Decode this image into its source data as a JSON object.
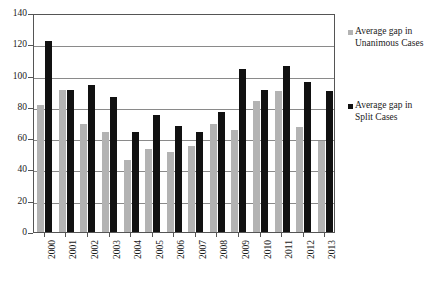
{
  "chart_data": {
    "type": "bar",
    "title": "",
    "subtitle": "",
    "xlabel": "",
    "ylabel": "",
    "ylim": [
      0,
      140
    ],
    "ytick_step": 20,
    "yticks": [
      0,
      20,
      40,
      60,
      80,
      100,
      120,
      140
    ],
    "grid": true,
    "legend_position": "right",
    "categories": [
      "2000",
      "2001",
      "2002",
      "2003",
      "2004",
      "2005",
      "2006",
      "2007",
      "2008",
      "2009",
      "2010",
      "2011",
      "2012",
      "2013"
    ],
    "series": [
      {
        "name": "Average gap in Unanimous Cases",
        "color": "#b3b3b3",
        "values": [
          81,
          91,
          69,
          64,
          46,
          53,
          51,
          55,
          69,
          65,
          84,
          90,
          67,
          58
        ]
      },
      {
        "name": "Average gap in Split Cases",
        "color": "#111111",
        "values": [
          122,
          91,
          94,
          86,
          64,
          75,
          68,
          64,
          77,
          104,
          91,
          106,
          96,
          90
        ]
      }
    ]
  },
  "legend": {
    "items": [
      {
        "label": "Average gap in Unanimous Cases",
        "swatch_color": "#b3b3b3"
      },
      {
        "label": "Average gap in Split Cases",
        "swatch_color": "#111111"
      }
    ]
  }
}
